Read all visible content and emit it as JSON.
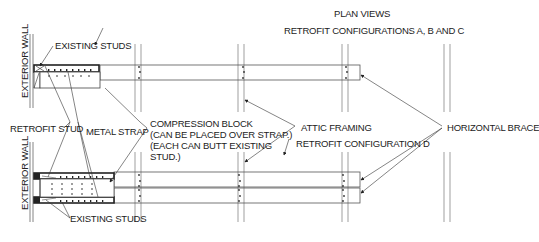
{
  "title": "PLAN VIEWS",
  "views": {
    "top": {
      "caption": "RETROFIT CONFIGURATIONS A, B AND C",
      "wall_label": "EXTERIOR WALL",
      "existing_studs_label": "EXISTING STUDS"
    },
    "bottom": {
      "caption": "RETROFIT CONFIGURATION D",
      "wall_label": "EXTERIOR WALL",
      "existing_studs_label": "EXISTING STUDS"
    }
  },
  "callouts": {
    "retrofit_stud": "RETROFIT STUD",
    "metal_strap": "METAL STRAP",
    "compression_block": [
      "COMPRESSION BLOCK",
      "(CAN BE PLACED OVER STRAP.)",
      "(EACH CAN BUTT EXISTING",
      "STUD.)"
    ],
    "attic_framing": "ATTIC FRAMING",
    "horizontal_brace": "HORIZONTAL BRACE"
  },
  "colors": {
    "line": "#555555",
    "dark": "#222222",
    "text": "#222222"
  }
}
